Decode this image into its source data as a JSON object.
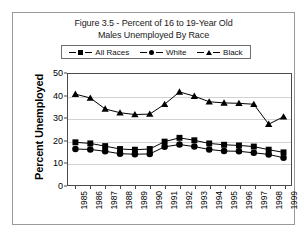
{
  "figure": {
    "title_line1": "Figure 3.5 - Percent of 16 to 19-Year Old",
    "title_line2": "Males Unemployed By Race"
  },
  "legend": {
    "position": "top-inside",
    "entries": [
      {
        "label": "All Races",
        "marker": "square-marker",
        "color": "#000000"
      },
      {
        "label": "White",
        "marker": "circle-marker",
        "color": "#000000"
      },
      {
        "label": "Black",
        "marker": "triangle-marker",
        "color": "#000000"
      }
    ]
  },
  "chart_data": {
    "type": "line",
    "title": "Figure 3.5 - Percent of 16 to 19-Year Old Males Unemployed By Race",
    "xlabel": "",
    "ylabel": "Percent Unemployed",
    "categories": [
      "1985",
      "1986",
      "1987",
      "1988",
      "1989",
      "1990",
      "1991",
      "1992",
      "1993",
      "1994",
      "1995",
      "1996",
      "1997",
      "1998",
      "1999"
    ],
    "series": [
      {
        "name": "All Races",
        "marker": "square",
        "values": [
          19.5,
          19.0,
          17.8,
          16.5,
          16.2,
          16.5,
          19.8,
          21.5,
          20.4,
          19.0,
          18.4,
          18.1,
          17.6,
          16.2,
          15.0
        ]
      },
      {
        "name": "White",
        "marker": "circle",
        "values": [
          16.5,
          16.3,
          15.5,
          14.4,
          14.2,
          14.3,
          17.5,
          18.5,
          17.6,
          16.3,
          15.6,
          15.5,
          14.8,
          14.1,
          12.6
        ]
      },
      {
        "name": "Black",
        "marker": "triangle",
        "values": [
          41.0,
          39.3,
          34.4,
          32.7,
          31.9,
          32.1,
          36.5,
          42.0,
          40.1,
          37.6,
          37.1,
          36.9,
          36.5,
          27.6,
          30.9
        ]
      }
    ],
    "ylim": [
      0,
      50
    ],
    "yticks": [
      0,
      10,
      20,
      30,
      40,
      50
    ],
    "grid": "horizontal",
    "legend_position": "top"
  }
}
